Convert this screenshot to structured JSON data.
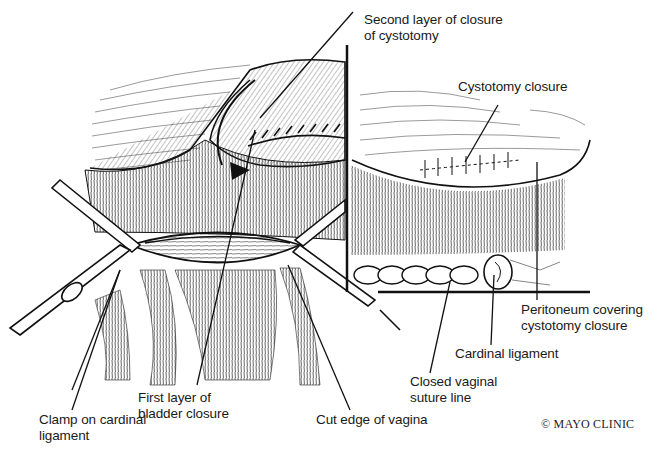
{
  "figure": {
    "type": "surgical-illustration",
    "left_view": "Vesicovaginal repair: bladder elevated, cystotomy closed in two layers, clamps on cardinal ligaments",
    "right_view": "Inset: peritoneum covering cystotomy closure and closed vaginal suture line"
  },
  "labels": {
    "second_layer": "Second layer of closure\nof cystotomy",
    "cystotomy_closure": "Cystotomy closure",
    "peritoneum": "Peritoneum covering\ncystotomy closure",
    "cardinal_ligament": "Cardinal ligament",
    "closed_vaginal": "Closed vaginal\nsuture line",
    "first_layer": "First layer of\nbladder closure",
    "cut_edge": "Cut edge of vagina",
    "clamp": "Clamp on cardinal\nligament"
  },
  "copyright": "© MAYO CLINIC",
  "colors": {
    "ink": "#111111",
    "paper": "#ffffff"
  }
}
